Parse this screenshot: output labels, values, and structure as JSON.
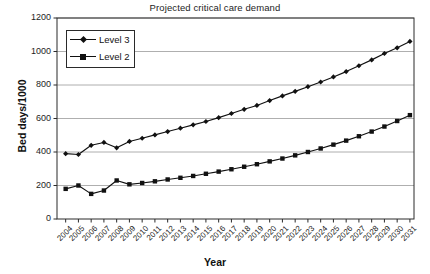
{
  "chart_data": {
    "type": "line",
    "title": "Projected critical care demand",
    "xlabel": "Year",
    "ylabel": "Bed days/1000",
    "grid": true,
    "legend_position": "top-left",
    "ylim": [
      0,
      1200
    ],
    "yticks": [
      0,
      200,
      400,
      600,
      800,
      1000,
      1200
    ],
    "categories": [
      "2004",
      "2005",
      "2006",
      "2007",
      "2008",
      "2009",
      "2010",
      "2011",
      "2012",
      "2013",
      "2014",
      "2015",
      "2016",
      "2017",
      "2018",
      "2019",
      "2020",
      "2021",
      "2022",
      "2023",
      "2024",
      "2025",
      "2026",
      "2027",
      "2028",
      "2029",
      "2030",
      "2031"
    ],
    "series": [
      {
        "name": "Level 3",
        "marker": "diamond",
        "color": "#111111",
        "values": [
          390,
          385,
          440,
          457,
          425,
          463,
          482,
          502,
          522,
          542,
          562,
          582,
          605,
          630,
          655,
          678,
          707,
          735,
          762,
          790,
          818,
          848,
          880,
          915,
          950,
          988,
          1022,
          1060
        ]
      },
      {
        "name": "Level 2",
        "marker": "square",
        "color": "#111111",
        "values": [
          180,
          200,
          150,
          170,
          230,
          207,
          215,
          225,
          236,
          246,
          257,
          270,
          283,
          297,
          312,
          327,
          344,
          361,
          380,
          400,
          421,
          444,
          468,
          494,
          522,
          552,
          585,
          620
        ]
      }
    ]
  },
  "axis": {
    "ytick_labels": [
      "1200",
      "1000",
      "800",
      "600",
      "400",
      "200",
      "0"
    ],
    "xtick_labels": [
      "2004",
      "2005",
      "2006",
      "2007",
      "2008",
      "2009",
      "2010",
      "2011",
      "2012",
      "2013",
      "2014",
      "2015",
      "2016",
      "2017",
      "2018",
      "2019",
      "2020",
      "2021",
      "2022",
      "2023",
      "2024",
      "2025",
      "2026",
      "2027",
      "2028",
      "2029",
      "2030",
      "2031"
    ]
  },
  "legend": {
    "items": [
      {
        "label": "Level 3",
        "marker": "diamond"
      },
      {
        "label": "Level 2",
        "marker": "square"
      }
    ]
  },
  "colors": {
    "series_line": "#111111",
    "grid": "#9a9a9a",
    "axis": "#2a2a2a",
    "background": "#ffffff"
  }
}
